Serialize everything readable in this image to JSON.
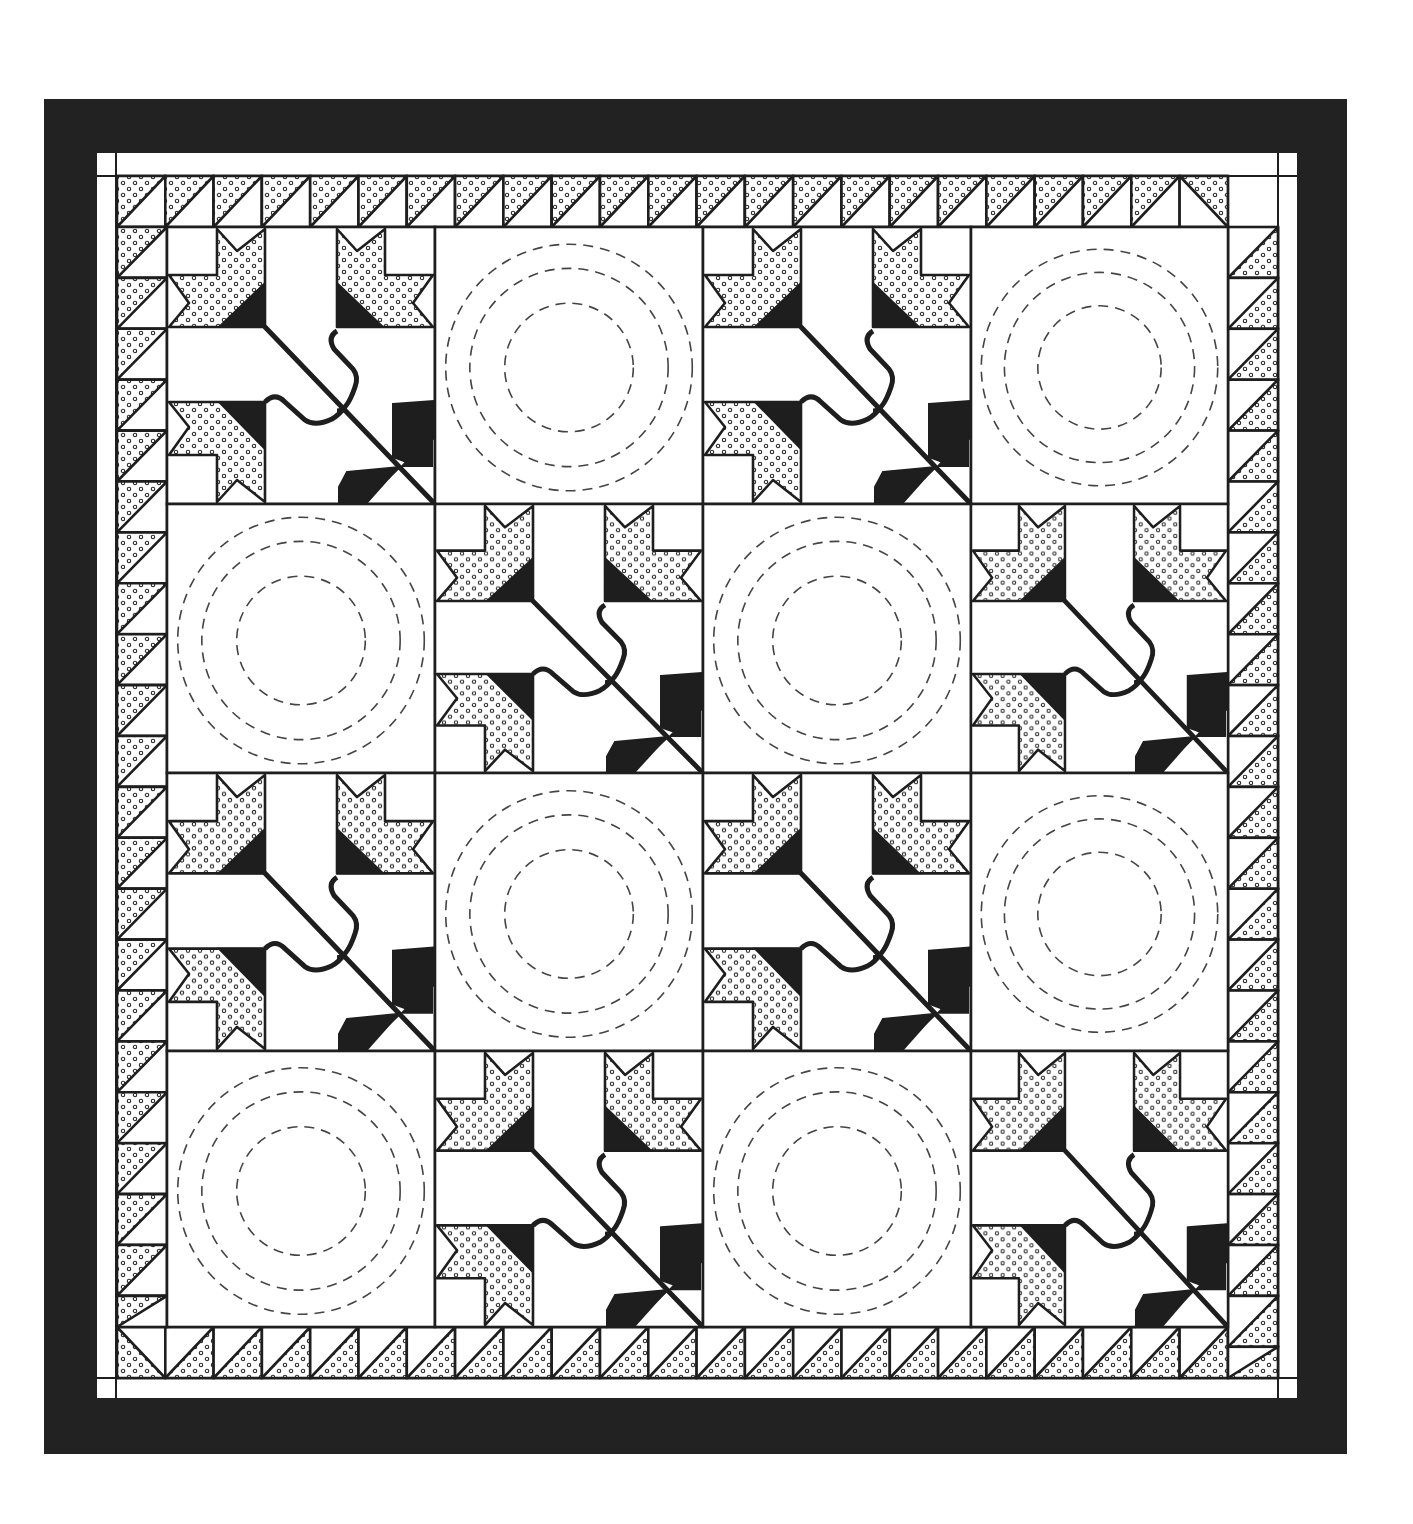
{
  "figure": {
    "width": 1413,
    "height": 1524,
    "background": "#ffffff"
  },
  "colors": {
    "ink": "#1e1e1e",
    "frame": "#222222",
    "paper": "#ffffff",
    "dots": "#2a2a2a",
    "quilting": "#444444"
  },
  "outer_border": {
    "x": 44,
    "y": 99,
    "x2": 1347,
    "y2": 1454,
    "style": "solid-black"
  },
  "inner_white_border": {
    "x": 97,
    "y": 153,
    "x2": 1297,
    "y2": 1398,
    "corner_lines": {
      "vx_left": 116,
      "vx_right": 1278,
      "hy_top": 176,
      "hy_bottom": 1378
    }
  },
  "sawtooth_border": {
    "description": "Half-square triangle border, dotted print and white",
    "top": {
      "y": 176,
      "h": 51,
      "x_start": 117,
      "count": 23,
      "unit": 48.3
    },
    "bottom": {
      "y": 1327,
      "h": 51,
      "x_start": 117,
      "count": 23,
      "unit": 48.3
    },
    "left": {
      "x": 117,
      "w": 50,
      "y_start": 227,
      "count": 22,
      "unit": 50.9
    },
    "right": {
      "x": 1228,
      "w": 50,
      "y_start": 176,
      "count": 23,
      "unit": 50.9
    }
  },
  "grid": {
    "x": 167,
    "y": 227,
    "cols": 4,
    "rows": 4,
    "col_edges": [
      167,
      435,
      703,
      971,
      1228
    ],
    "row_edges": [
      227,
      504,
      773,
      1051,
      1327
    ]
  },
  "blocks": [
    [
      "lily",
      "circles",
      "lily",
      "circles"
    ],
    [
      "circles",
      "lily",
      "circles",
      "lily"
    ],
    [
      "lily",
      "circles",
      "lily",
      "circles"
    ],
    [
      "circles",
      "lily",
      "circles",
      "lily"
    ]
  ],
  "block_types": {
    "lily": {
      "description": "Three-lily appliqué block: two dotted star-lilies at top, one at lower-left, black calyx wedges, curved stems meeting at a diagonal, black leaf wedges at lower-right"
    },
    "circles": {
      "description": "Plain block with three concentric dashed quilting circles",
      "radii_ratio": [
        0.46,
        0.37,
        0.24
      ]
    }
  }
}
